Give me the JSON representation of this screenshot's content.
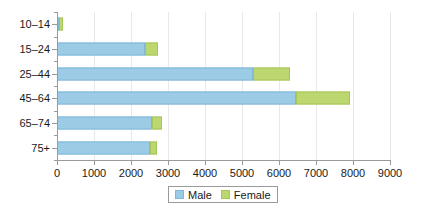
{
  "chart_data": {
    "type": "bar",
    "orientation": "horizontal",
    "stacked": true,
    "title": "",
    "subtitle": "",
    "xlabel": "",
    "ylabel": "",
    "categories": [
      "10–14",
      "15–24",
      "25–44",
      "45–64",
      "65–74",
      "75+"
    ],
    "series": [
      {
        "name": "Male",
        "color": "#9ccbe6",
        "values": [
          30,
          2380,
          5300,
          6460,
          2570,
          2510
        ]
      },
      {
        "name": "Female",
        "color": "#bcd670",
        "values": [
          100,
          350,
          1000,
          1460,
          270,
          190
        ]
      }
    ],
    "totals": [
      130,
      2730,
      6300,
      7920,
      2840,
      2700
    ],
    "xlim": [
      0,
      9000
    ],
    "xticks": [
      0,
      1000,
      2000,
      3000,
      4000,
      5000,
      6000,
      7000,
      8000,
      9000
    ],
    "xtick_labels": [
      "0",
      "1000",
      "2000",
      "3000",
      "4000",
      "5000",
      "6000",
      "7000",
      "8000",
      "9000"
    ],
    "grid": true,
    "grid_axis": "x",
    "legend": {
      "position": "bottom-center",
      "entries": [
        "Male",
        "Female"
      ]
    }
  },
  "colors": {
    "male": "#9ccbe6",
    "male_border": "#7fb8da",
    "female": "#bcd670",
    "female_border": "#a8c55a",
    "grid": "#e8e8e8",
    "axis": "#9a9a9a",
    "text": "#1a1a1a",
    "background": "#ffffff"
  }
}
